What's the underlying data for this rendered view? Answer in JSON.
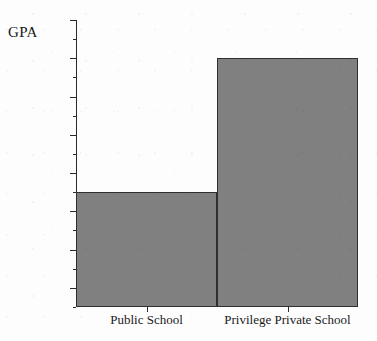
{
  "chart_data": {
    "type": "bar",
    "title": "",
    "xlabel": "",
    "ylabel": "GPA",
    "categories": [
      "Public School",
      "Privilege Private School"
    ],
    "values": [
      3.1,
      3.8
    ],
    "ylim": [
      2.5,
      4.0
    ],
    "ytick_labels": [
      "4.0",
      "3.8",
      "3.6",
      "3.4",
      "3.2",
      "3.0",
      "2.8",
      "2.6"
    ],
    "ytick_values": [
      4.0,
      3.8,
      3.6,
      3.4,
      3.2,
      3.0,
      2.8,
      2.6
    ],
    "yminor_values": [
      3.9,
      3.7,
      3.5,
      3.3,
      3.1,
      2.9,
      2.7,
      2.5
    ],
    "grid": false,
    "legend": false,
    "bar_fill_color": "#808080",
    "bar_edge_color": "#2f2f2f",
    "axis_color": "#2a2a2a",
    "background_color": "#fdfdfd"
  },
  "axis": {
    "y_title": "GPA"
  }
}
